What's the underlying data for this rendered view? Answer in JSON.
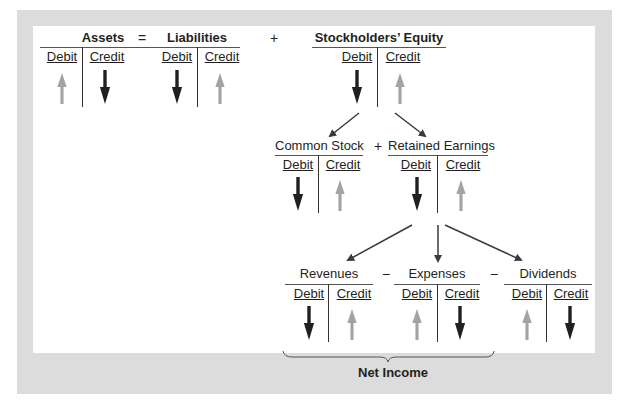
{
  "colors": {
    "frame": "#dcdcdc",
    "panel": "#ffffff",
    "increase_arrow": "#a3a3a3",
    "decrease_arrow": "#231f20",
    "connector": "#3a3a3a"
  },
  "equation": {
    "equals": "=",
    "plus": "+",
    "plus2": "+",
    "minus1": "−",
    "minus2": "−"
  },
  "accounts": {
    "assets": {
      "title": "Assets",
      "debit": "Debit",
      "credit": "Credit",
      "debit_arrow": "increase-up",
      "credit_arrow": "decrease-down"
    },
    "liabilities": {
      "title": "Liabilities",
      "debit": "Debit",
      "credit": "Credit",
      "debit_arrow": "decrease-down",
      "credit_arrow": "increase-up"
    },
    "equity": {
      "title": "Stockholders’ Equity",
      "debit": "Debit",
      "credit": "Credit",
      "debit_arrow": "decrease-down",
      "credit_arrow": "increase-up"
    },
    "common_stock": {
      "title": "Common Stock",
      "debit": "Debit",
      "credit": "Credit",
      "debit_arrow": "decrease-down",
      "credit_arrow": "increase-up"
    },
    "retained": {
      "title": "Retained Earnings",
      "debit": "Debit",
      "credit": "Credit",
      "debit_arrow": "decrease-down",
      "credit_arrow": "increase-up"
    },
    "revenues": {
      "title": "Revenues",
      "debit": "Debit",
      "credit": "Credit",
      "debit_arrow": "decrease-down",
      "credit_arrow": "increase-up"
    },
    "expenses": {
      "title": "Expenses",
      "debit": "Debit",
      "credit": "Credit",
      "debit_arrow": "increase-up",
      "credit_arrow": "decrease-down"
    },
    "dividends": {
      "title": "Dividends",
      "debit": "Debit",
      "credit": "Credit",
      "debit_arrow": "increase-up",
      "credit_arrow": "decrease-down"
    }
  },
  "net_income": {
    "label": "Net Income"
  }
}
